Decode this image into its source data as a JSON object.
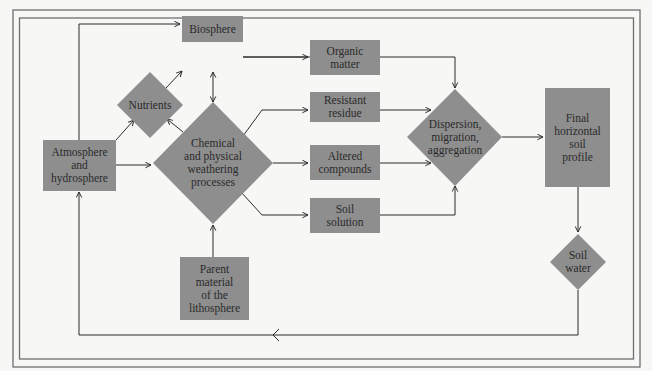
{
  "diagram": {
    "type": "flowchart",
    "title_clipped": "",
    "colors": {
      "node_fill": "#8e8e8e",
      "edge_stroke": "#2b2b2b",
      "frame_stroke": "#6f6f6f",
      "background": "#f7f7f5",
      "text": "#2a2a2a"
    },
    "nodes": {
      "biosphere": {
        "label": "Biosphere",
        "shape": "rectangle"
      },
      "nutrients": {
        "label": "Nutrients",
        "shape": "diamond"
      },
      "atmosphere": {
        "label": "Atmosphere\nand\nhydrosphere",
        "shape": "rectangle"
      },
      "weathering": {
        "label": "Chemical\nand physical\nweathering\nprocesses",
        "shape": "diamond"
      },
      "organic_matter": {
        "label": "Organic\nmatter",
        "shape": "rectangle"
      },
      "resistant_residue": {
        "label": "Resistant\nresidue",
        "shape": "rectangle"
      },
      "altered_compounds": {
        "label": "Altered\ncompounds",
        "shape": "rectangle"
      },
      "soil_solution": {
        "label": "Soil\nsolution",
        "shape": "rectangle"
      },
      "dispersion": {
        "label": "Dispersion,\nmigration,\naggregation",
        "shape": "diamond"
      },
      "final_profile": {
        "label": "Final\nhorizontal\nsoil\nprofile",
        "shape": "rectangle"
      },
      "soil_water": {
        "label": "Soil\nwater",
        "shape": "diamond"
      },
      "parent_material": {
        "label": "Parent\nmaterial\nof the\nlithosphere",
        "shape": "rectangle"
      }
    },
    "edges": [
      {
        "from": "atmosphere",
        "to": "biosphere"
      },
      {
        "from": "atmosphere",
        "to": "nutrients"
      },
      {
        "from": "atmosphere",
        "to": "weathering"
      },
      {
        "from": "nutrients",
        "to": "biosphere"
      },
      {
        "from": "weathering",
        "to": "nutrients"
      },
      {
        "from": "biosphere",
        "to": "weathering",
        "bidirectional": true
      },
      {
        "from": "biosphere",
        "to": "dispersion"
      },
      {
        "from": "weathering",
        "to": "resistant_residue"
      },
      {
        "from": "weathering",
        "to": "altered_compounds"
      },
      {
        "from": "weathering",
        "to": "soil_solution"
      },
      {
        "from": "parent_material",
        "to": "weathering"
      },
      {
        "from": "organic_matter",
        "to": "dispersion"
      },
      {
        "from": "resistant_residue",
        "to": "dispersion"
      },
      {
        "from": "altered_compounds",
        "to": "dispersion"
      },
      {
        "from": "soil_solution",
        "to": "dispersion"
      },
      {
        "from": "dispersion",
        "to": "final_profile"
      },
      {
        "from": "final_profile",
        "to": "soil_water"
      },
      {
        "from": "soil_water",
        "to": "atmosphere"
      }
    ]
  }
}
